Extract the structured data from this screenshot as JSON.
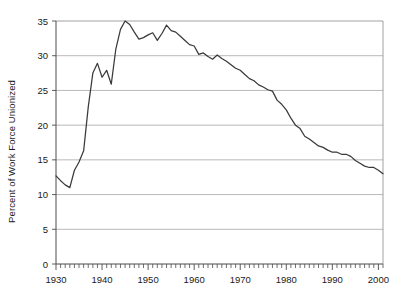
{
  "chart_data": {
    "type": "line",
    "title": "",
    "xlabel": "",
    "ylabel": "Percent of Work Force Unionized",
    "xlim": [
      1930,
      2001
    ],
    "ylim": [
      0,
      35
    ],
    "grid": true,
    "legend": "none",
    "y_ticks": [
      0,
      5,
      10,
      15,
      20,
      25,
      30,
      35
    ],
    "y_tick_labels": [
      "0",
      "5",
      "10",
      "15",
      "20",
      "25",
      "30",
      "35"
    ],
    "x_ticks": [
      1930,
      1940,
      1950,
      1960,
      1970,
      1980,
      1990,
      2000
    ],
    "x_tick_labels": [
      "1930",
      "1940",
      "1950",
      "1960",
      "1970",
      "1980",
      "1990",
      "2000"
    ],
    "x_minor_tick_interval": 1,
    "line_color": "#3a3a3a",
    "series": [
      {
        "name": "Percent of Work Force Unionized",
        "x": [
          1930,
          1931,
          1932,
          1933,
          1934,
          1935,
          1936,
          1937,
          1938,
          1939,
          1940,
          1941,
          1942,
          1943,
          1944,
          1945,
          1946,
          1947,
          1948,
          1949,
          1950,
          1951,
          1952,
          1953,
          1954,
          1955,
          1956,
          1957,
          1958,
          1959,
          1960,
          1961,
          1962,
          1963,
          1964,
          1965,
          1966,
          1967,
          1968,
          1969,
          1970,
          1971,
          1972,
          1973,
          1974,
          1975,
          1976,
          1977,
          1978,
          1979,
          1980,
          1981,
          1982,
          1983,
          1984,
          1985,
          1986,
          1987,
          1988,
          1989,
          1990,
          1991,
          1992,
          1993,
          1994,
          1995,
          1996,
          1997,
          1998,
          1999,
          2000,
          2001
        ],
        "values": [
          12.7,
          12.0,
          11.4,
          11.0,
          13.5,
          14.7,
          16.3,
          22.6,
          27.5,
          28.9,
          26.9,
          27.9,
          25.9,
          31.0,
          33.8,
          35.0,
          34.5,
          33.4,
          32.4,
          32.6,
          33.0,
          33.3,
          32.2,
          33.2,
          34.4,
          33.6,
          33.4,
          32.8,
          32.2,
          31.6,
          31.4,
          30.2,
          30.4,
          29.9,
          29.5,
          30.1,
          29.6,
          29.2,
          28.7,
          28.2,
          27.9,
          27.3,
          26.7,
          26.4,
          25.8,
          25.5,
          25.1,
          24.9,
          23.6,
          23.0,
          22.2,
          21.0,
          20.0,
          19.5,
          18.4,
          18.0,
          17.5,
          17.0,
          16.8,
          16.4,
          16.1,
          16.1,
          15.8,
          15.8,
          15.5,
          14.9,
          14.5,
          14.1,
          13.9,
          13.9,
          13.5,
          13.0
        ]
      }
    ]
  }
}
